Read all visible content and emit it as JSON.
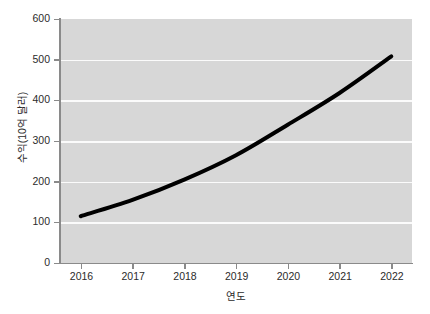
{
  "chart_data": {
    "type": "line",
    "title": "",
    "xlabel": "연도",
    "ylabel": "수익(10억 달러)",
    "categories": [
      "2016",
      "2017",
      "2018",
      "2019",
      "2020",
      "2021",
      "2022"
    ],
    "x": [
      2016,
      2017,
      2018,
      2019,
      2020,
      2021,
      2022
    ],
    "values": [
      115,
      155,
      205,
      265,
      340,
      418,
      508
    ],
    "series": [
      {
        "name": "수익",
        "values": [
          115,
          155,
          205,
          265,
          340,
          418,
          508
        ],
        "color": "#000000"
      }
    ],
    "xlim": [
      2015.6,
      2022.4
    ],
    "ylim": [
      0,
      600
    ],
    "yticks": [
      0,
      100,
      200,
      300,
      400,
      500,
      600
    ],
    "ytick_labels": [
      "0",
      "100",
      "200",
      "300",
      "400",
      "500",
      "600"
    ],
    "xticks": [
      2016,
      2017,
      2018,
      2019,
      2020,
      2021,
      2022
    ],
    "xtick_labels": [
      "2016",
      "2017",
      "2018",
      "2019",
      "2020",
      "2021",
      "2022"
    ],
    "grid": "horizontal",
    "gridline_color": "#fbfbfb",
    "plot_background": "#d7d7d7",
    "figure_background": "#ffffff",
    "legend": null,
    "legend_position": "none",
    "line_width": 4,
    "annotations": []
  }
}
